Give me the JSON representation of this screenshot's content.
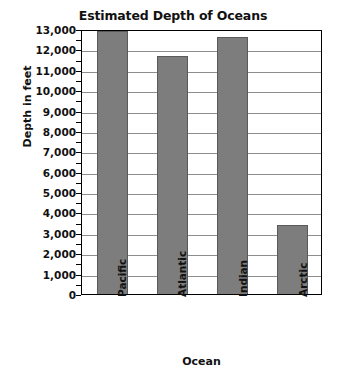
{
  "chart_data": {
    "type": "bar",
    "title": "Estimated Depth of Oceans",
    "xlabel": "Ocean",
    "ylabel": "Depth in feet",
    "categories": [
      "Pacific",
      "Atlantic",
      "Indian",
      "Arctic"
    ],
    "values": [
      12900,
      11700,
      12600,
      3400
    ],
    "ylim": [
      0,
      13000
    ],
    "ytick_step": 1000,
    "yminor_step": 500,
    "ytick_labels": [
      "13,000",
      "12,000",
      "11,000",
      "10,000",
      "9,000",
      "8,000",
      "7,000",
      "6,000",
      "5,000",
      "4,000",
      "3,000",
      "2,000",
      "1,000",
      "0"
    ],
    "ytick_values": [
      13000,
      12000,
      11000,
      10000,
      9000,
      8000,
      7000,
      6000,
      5000,
      4000,
      3000,
      2000,
      1000,
      0
    ],
    "grid": true,
    "legend": false,
    "bar_color": "#7d7d7d",
    "bar_edge_color": "#5a5a5a",
    "grid_color": "#8d8d8d",
    "axis_color": "#000000",
    "background_color": "#ffffff"
  }
}
